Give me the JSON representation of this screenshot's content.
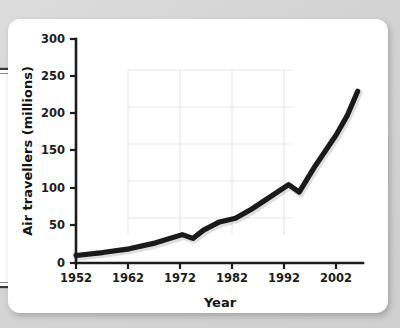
{
  "card": {
    "background_color": "#ffffff",
    "page_background_color": "#d6d6d6"
  },
  "chart_data": {
    "type": "line",
    "title": "",
    "subtitle": "",
    "xlabel": "Year",
    "ylabel": "Air travellers (millions)",
    "xlim": [
      1952,
      2006
    ],
    "ylim": [
      0,
      300
    ],
    "xticks": [
      1952,
      1962,
      1972,
      1982,
      1992,
      2002
    ],
    "xticklabels": [
      "1952",
      "1962",
      "1972",
      "1982",
      "1992",
      "2002"
    ],
    "yticks": [
      0,
      50,
      100,
      150,
      200,
      250,
      300
    ],
    "yticklabels": [
      "0",
      "50",
      "100",
      "150",
      "200",
      "250",
      "300"
    ],
    "grid": "partial-faint",
    "legend": "none",
    "line_color": "#1a1a1a",
    "series": [
      {
        "name": "Air travellers",
        "x": [
          1952,
          1957,
          1962,
          1967,
          1972,
          1974,
          1976,
          1979,
          1982,
          1985,
          1988,
          1992,
          1994,
          1997,
          2001,
          2003,
          2005
        ],
        "values": [
          10,
          14,
          19,
          27,
          38,
          33,
          44,
          55,
          60,
          72,
          86,
          105,
          95,
          130,
          172,
          197,
          230
        ]
      }
    ],
    "annotations": [
      "Local peak at 1972 (~38) followed by dip to ~33 in 1974",
      "Local peak at 1992 (~105) followed by dip to ~95 in 1994",
      "Steep rise from 1994 to 2005 ending at ~230"
    ]
  }
}
